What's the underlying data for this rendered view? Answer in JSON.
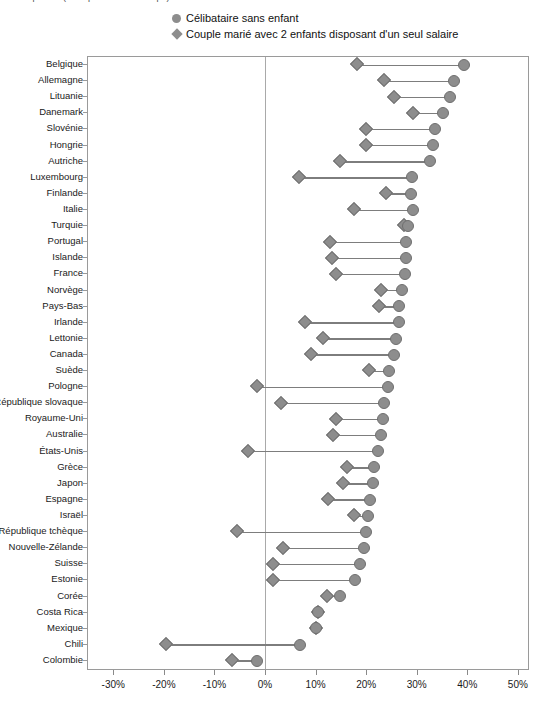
{
  "header": {
    "cropped_text": "Coin supérieur (texte partiellement coupé)"
  },
  "legend": {
    "position": "top-center",
    "items": [
      {
        "marker": "circle-marker-icon",
        "label": "Célibataire sans enfant",
        "color": "#8d8d8d"
      },
      {
        "marker": "diamond-marker-icon",
        "label": "Couple marié avec 2 enfants disposant d'un seul salaire",
        "color": "#8d8d8d"
      }
    ]
  },
  "axis": {
    "x_ticks": [
      "-30%",
      "-20%",
      "-10%",
      "0%",
      "10%",
      "20%",
      "30%",
      "40%",
      "50%"
    ],
    "x_tick_values": [
      -30,
      -20,
      -10,
      0,
      10,
      20,
      30,
      40,
      50
    ],
    "xmin": -35,
    "xmax": 52
  },
  "chart_data": {
    "type": "scatter",
    "subtype": "dumbbell",
    "title": "",
    "subtitle": "",
    "xlabel": "",
    "ylabel": "",
    "xlim": [
      -35,
      52
    ],
    "grid": false,
    "legend_position": "top-center",
    "categories": [
      "Belgique",
      "Allemagne",
      "Lituanie",
      "Danemark",
      "Slovénie",
      "Hongrie",
      "Autriche",
      "Luxembourg",
      "Finlande",
      "Italie",
      "Turquie",
      "Portugal",
      "Islande",
      "France",
      "Norvège",
      "Pays-Bas",
      "Irlande",
      "Lettonie",
      "Canada",
      "Suède",
      "Pologne",
      "République slovaque",
      "Royaume-Uni",
      "Australie",
      "États-Unis",
      "Grèce",
      "Japon",
      "Espagne",
      "Israël",
      "République tchèque",
      "Nouvelle-Zélande",
      "Suisse",
      "Estonie",
      "Corée",
      "Costa Rica",
      "Mexique",
      "Chili",
      "Colombie"
    ],
    "series": [
      {
        "name": "Célibataire sans enfant",
        "marker": "circle",
        "color": "#8d8d8d",
        "values": [
          39.3,
          37.4,
          36.5,
          35.2,
          33.6,
          33.2,
          32.7,
          29.0,
          28.8,
          29.2,
          28.3,
          27.8,
          27.8,
          27.6,
          27.0,
          26.5,
          26.5,
          25.9,
          25.6,
          24.5,
          24.3,
          23.6,
          23.3,
          23.0,
          22.4,
          21.6,
          21.3,
          20.7,
          20.3,
          20.0,
          19.5,
          18.8,
          17.8,
          14.8,
          10.4,
          10.0,
          7.0,
          -1.5
        ]
      },
      {
        "name": "Couple marié avec 2 enfants disposant d'un seul salaire",
        "marker": "diamond",
        "color": "#8d8d8d",
        "values": [
          18.1,
          23.5,
          25.5,
          29.2,
          20.0,
          20.0,
          14.8,
          6.7,
          24.0,
          17.5,
          27.5,
          12.8,
          13.2,
          14.0,
          23.0,
          22.5,
          8.0,
          11.5,
          9.0,
          20.6,
          -1.5,
          3.2,
          14.0,
          13.5,
          -3.3,
          16.3,
          15.5,
          12.5,
          17.5,
          -5.5,
          3.5,
          1.5,
          1.5,
          12.2,
          10.4,
          10.0,
          -19.6,
          -6.5
        ]
      }
    ]
  }
}
